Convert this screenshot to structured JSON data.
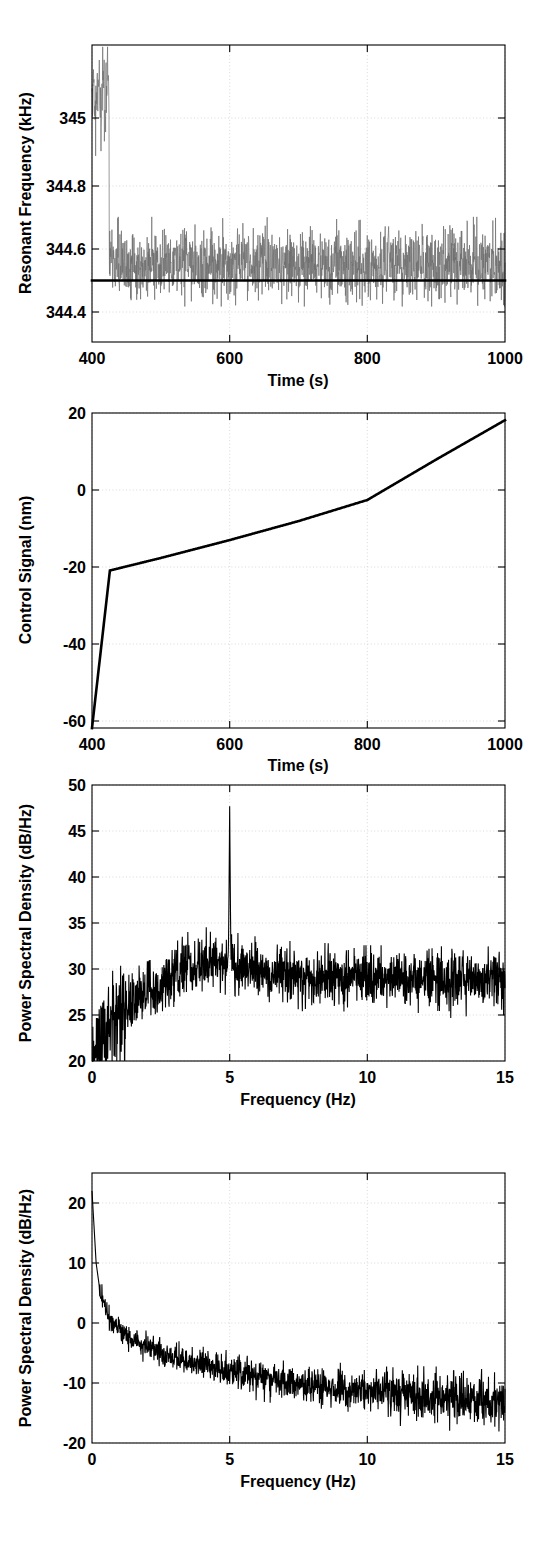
{
  "figure": {
    "background": "#ffffff",
    "trace_color_noise": "#6e6e6e",
    "trace_color_line": "#000000",
    "grid_color": "#cfcfcf",
    "panel_count": 4
  },
  "chart_data": [
    {
      "id": "panel-1-resonant-frequency",
      "type": "line",
      "title": "",
      "xlabel": "Time (s)",
      "ylabel": "Resonant Frequency (kHz)",
      "xlim": [
        400,
        1000
      ],
      "ylim": [
        344.3,
        345.12
      ],
      "xticks": [
        400,
        600,
        800,
        1000
      ],
      "xticklabels": [
        "400",
        "600",
        "800",
        "1000"
      ],
      "yticks": [
        344.4,
        344.6,
        344.8,
        345
      ],
      "yticklabels": [
        "344.4",
        "344.6",
        "344.8",
        "345"
      ],
      "grid": true,
      "legend": "none",
      "series": [
        {
          "name": "resonant frequency (noisy measurement)",
          "color": "#6e6e6e",
          "description": "Large amplitude transient oscillating about 345.0 kHz between t=400 and t=425 s, then settling into a narrow noise band centred on 344.5 kHz with spread roughly 344.40 to 344.63 kHz for the remainder of the record.",
          "transient": {
            "t_start": 400,
            "t_end": 425,
            "center": 344.98,
            "amplitude": 0.14
          },
          "steady": {
            "t_start": 425,
            "t_end": 1000,
            "center": 344.515,
            "spread_low": 344.4,
            "spread_high": 344.63
          }
        },
        {
          "name": "setpoint",
          "color": "#000000",
          "description": "Flat bold horizontal reference line at 344.50 kHz spanning the full time axis.",
          "value": 344.5
        }
      ]
    },
    {
      "id": "panel-2-control-signal",
      "type": "line",
      "title": "",
      "xlabel": "Time (s)",
      "ylabel": "Control Signal (nm)",
      "xlim": [
        400,
        1000
      ],
      "ylim": [
        -68,
        20
      ],
      "xticks": [
        400,
        600,
        800,
        1000
      ],
      "xticklabels": [
        "400",
        "600",
        "800",
        "1000"
      ],
      "yticks": [
        -60,
        -40,
        -20,
        0,
        20
      ],
      "yticklabels": [
        "-60",
        "-40",
        "-20",
        "0",
        "20"
      ],
      "grid": true,
      "legend": "none",
      "series": [
        {
          "name": "control signal",
          "color": "#000000",
          "description": "Steep rise from -68 nm at t=400 s to -24 nm at t=426 s, then a near-linear ramp up through 0 nm at about t=770 s, reaching +18 nm at t=1000 s.",
          "x": [
            400,
            426,
            500,
            600,
            700,
            800,
            900,
            1000
          ],
          "y": [
            -68,
            -24,
            -20.5,
            -15.5,
            -10.2,
            -4.3,
            7.0,
            18.0
          ]
        }
      ]
    },
    {
      "id": "panel-3-psd-closed-loop",
      "type": "line",
      "title": "",
      "xlabel": "Frequency (Hz)",
      "ylabel": "Power Spectral Density (dB/Hz)",
      "xlim": [
        0,
        15
      ],
      "ylim": [
        20,
        50
      ],
      "xticks": [
        0,
        5,
        10,
        15
      ],
      "xticklabels": [
        "0",
        "5",
        "10",
        "15"
      ],
      "yticks": [
        20,
        25,
        30,
        35,
        40,
        45,
        50
      ],
      "yticklabels": [
        "20",
        "25",
        "30",
        "35",
        "40",
        "45",
        "50"
      ],
      "grid": true,
      "legend": "none",
      "series": [
        {
          "name": "power spectral density",
          "color": "#000000",
          "description": "Noisy spectrum rising steeply from 20 dB/Hz near DC to about 27 dB/Hz at 1.5 Hz, peaking in a broad hump near 30-33 dB/Hz around 3.5-4.5 Hz, then a flat noise floor near 29 dB/Hz out to 15 Hz. A single narrow spectral spike at 5 Hz reaches 47.7 dB/Hz.",
          "baseline_points": [
            {
              "f": 0.0,
              "psd": 20.0
            },
            {
              "f": 0.3,
              "psd": 21.5
            },
            {
              "f": 0.8,
              "psd": 24.5
            },
            {
              "f": 1.5,
              "psd": 26.5
            },
            {
              "f": 2.5,
              "psd": 28.0
            },
            {
              "f": 3.5,
              "psd": 30.5
            },
            {
              "f": 4.2,
              "psd": 31.0
            },
            {
              "f": 5.0,
              "psd": 30.5
            },
            {
              "f": 7.0,
              "psd": 29.5
            },
            {
              "f": 10.0,
              "psd": 29.0
            },
            {
              "f": 12.5,
              "psd": 29.0
            },
            {
              "f": 15.0,
              "psd": 29.0
            }
          ],
          "noise_amplitude": 2.4,
          "spike": {
            "frequency": 5.0,
            "peak_psd": 47.7
          }
        }
      ]
    },
    {
      "id": "panel-4-psd-open-loop",
      "type": "line",
      "title": "",
      "xlabel": "Frequency (Hz)",
      "ylabel": "Power Spectral Density (dB/Hz)",
      "xlim": [
        0,
        15
      ],
      "ylim": [
        -20,
        25
      ],
      "xticks": [
        0,
        5,
        10,
        15
      ],
      "xticklabels": [
        "0",
        "5",
        "10",
        "15"
      ],
      "yticks": [
        -20,
        -10,
        0,
        10,
        20
      ],
      "yticklabels": [
        "-20",
        "-10",
        "0",
        "10",
        "20"
      ],
      "grid": true,
      "legend": "none",
      "series": [
        {
          "name": "power spectral density",
          "color": "#000000",
          "description": "Monotonic 1/f-like roll-off: peak of 22 dB/Hz at DC falling rapidly through 5 dB/Hz at 0.3 Hz and 0 dB/Hz near 0.7 Hz, then a slow decay to about -7 dB/Hz at 4 Hz, -11 dB/Hz at 9 Hz and roughly -13 dB/Hz at 15 Hz, with noise scatter of a few dB growing toward high frequency.",
          "baseline_points": [
            {
              "f": 0.0,
              "psd": 22.0
            },
            {
              "f": 0.15,
              "psd": 10.0
            },
            {
              "f": 0.3,
              "psd": 5.0
            },
            {
              "f": 0.7,
              "psd": 0.0
            },
            {
              "f": 1.2,
              "psd": -2.0
            },
            {
              "f": 2.0,
              "psd": -4.0
            },
            {
              "f": 3.0,
              "psd": -5.8
            },
            {
              "f": 4.0,
              "psd": -7.0
            },
            {
              "f": 6.0,
              "psd": -9.0
            },
            {
              "f": 9.0,
              "psd": -11.0
            },
            {
              "f": 12.0,
              "psd": -12.2
            },
            {
              "f": 15.0,
              "psd": -13.0
            }
          ],
          "noise_amplitude_low": 1.2,
          "noise_amplitude_high": 2.8
        }
      ]
    }
  ]
}
